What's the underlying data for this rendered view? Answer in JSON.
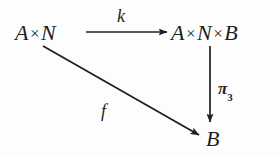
{
  "diagram": {
    "kind": "commutative-diagram",
    "shape": "triangle",
    "background_color": "#fdfdfd",
    "stroke_color": "#1f1f1f",
    "nodes": [
      {
        "id": "source",
        "label": "A×N",
        "parts": [
          "A",
          "×",
          "N"
        ],
        "position": "top-left",
        "x": 15,
        "y": 22
      },
      {
        "id": "product",
        "label": "A×N×B",
        "parts": [
          "A",
          "×",
          "N",
          "×",
          "B"
        ],
        "position": "top-right",
        "x": 171,
        "y": 22
      },
      {
        "id": "target",
        "label": "B",
        "parts": [
          "B"
        ],
        "position": "bottom-right",
        "x": 206,
        "y": 128
      }
    ],
    "arrows": [
      {
        "id": "k-arrow",
        "from": "source",
        "to": "product",
        "label": "k",
        "label_subscript": "",
        "orientation": "horizontal",
        "x1": 86,
        "y1": 32,
        "x2": 167,
        "y2": 32
      },
      {
        "id": "pi3-arrow",
        "from": "product",
        "to": "target",
        "label": "π",
        "label_subscript": "3",
        "orientation": "vertical",
        "x1": 210,
        "y1": 46,
        "x2": 210,
        "y2": 122
      },
      {
        "id": "f-arrow",
        "from": "source",
        "to": "target",
        "label": "f",
        "label_subscript": "",
        "orientation": "diagonal",
        "x1": 43,
        "y1": 46,
        "x2": 199,
        "y2": 135
      }
    ]
  }
}
